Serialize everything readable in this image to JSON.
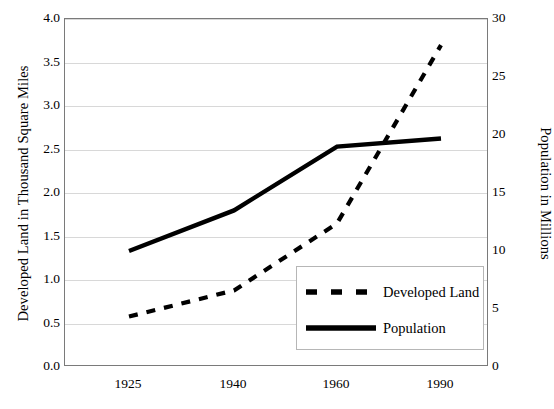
{
  "chart_data": {
    "type": "line",
    "title": "",
    "xlabel": "",
    "x": [
      1925,
      1940,
      1960,
      1990
    ],
    "xtick_labels": [
      "1925",
      "1940",
      "1960",
      "1990"
    ],
    "grid": true,
    "legend_position": "lower-right",
    "axes": {
      "left": {
        "label": "Developed Land in Thousand Square Miles",
        "min": 0.0,
        "max": 4.0,
        "step": 0.5,
        "ticks": [
          "0.0",
          "0.5",
          "1.0",
          "1.5",
          "2.0",
          "2.5",
          "3.0",
          "3.5",
          "4.0"
        ]
      },
      "right": {
        "label": "Population in Millions",
        "min": 0,
        "max": 30,
        "step": 5,
        "ticks": [
          "0",
          "5",
          "10",
          "15",
          "20",
          "25",
          "30"
        ]
      }
    },
    "series": [
      {
        "name": "Developed Land",
        "axis": "left",
        "style": "dashed",
        "color": "#000000",
        "units": "thousand square miles",
        "values": [
          0.58,
          0.88,
          1.65,
          3.7
        ]
      },
      {
        "name": "Population",
        "axis": "right",
        "style": "solid",
        "color": "#000000",
        "units": "millions",
        "values": [
          10.0,
          13.5,
          19.0,
          19.7
        ]
      }
    ]
  },
  "legend": {
    "entries": [
      {
        "label": "Developed Land",
        "style": "dashed"
      },
      {
        "label": "Population",
        "style": "solid"
      }
    ]
  }
}
